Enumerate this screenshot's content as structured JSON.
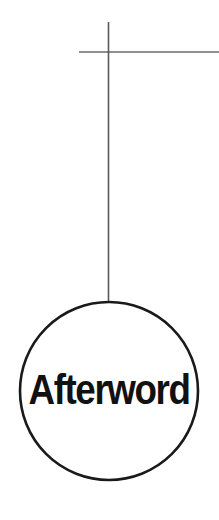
{
  "page": {
    "background_color": "#ffffff",
    "width": 219,
    "height": 520
  },
  "diagram": {
    "type": "node-with-connector",
    "node": {
      "label": "Afterword",
      "shape": "circle",
      "center_x": 109,
      "center_y": 391,
      "radius": 89,
      "stroke_color": "#1a1a1a",
      "stroke_width": 2.6,
      "fill_color": "#ffffff",
      "label_color": "#111111",
      "label_font_size": 42,
      "label_baseline_y": 404
    },
    "connectors": [
      {
        "name": "vertical-stem",
        "orientation": "vertical",
        "x": 108.5,
        "y_start": 22,
        "y_end": 303,
        "color": "#5a5a5a",
        "width": 1.6
      },
      {
        "name": "horizontal-rule",
        "orientation": "horizontal",
        "y": 52,
        "x_start": 79,
        "x_end": 219,
        "color": "#6a6a6a",
        "width": 1.6
      }
    ]
  }
}
